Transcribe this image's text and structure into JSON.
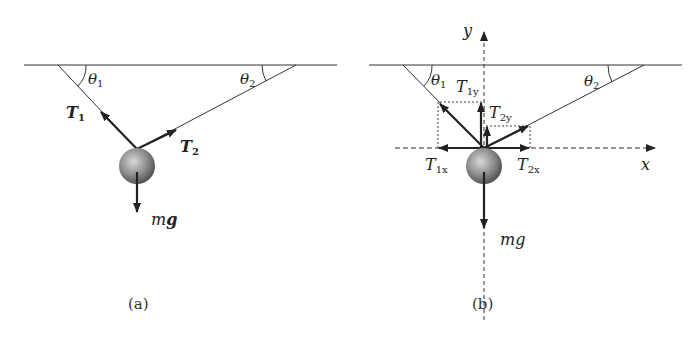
{
  "figure": {
    "panel_a": {
      "caption": "(a)",
      "angle_left": {
        "symbol": "θ",
        "sub": "1"
      },
      "angle_right": {
        "symbol": "θ",
        "sub": "2"
      },
      "tension_1": {
        "symbol": "T",
        "sub": "1"
      },
      "tension_2": {
        "symbol": "T",
        "sub": "2"
      },
      "weight": {
        "prefix": "m",
        "symbol": "g"
      }
    },
    "panel_b": {
      "caption": "(b)",
      "angle_left": {
        "symbol": "θ",
        "sub": "1"
      },
      "angle_right": {
        "symbol": "θ",
        "sub": "2"
      },
      "t1y": {
        "symbol": "T",
        "sub": "1y"
      },
      "t2y": {
        "symbol": "T",
        "sub": "2y"
      },
      "t1x": {
        "symbol": "T",
        "sub": "1x"
      },
      "t2x": {
        "symbol": "T",
        "sub": "2x"
      },
      "weight": "mg",
      "axis_x": "x",
      "axis_y": "y"
    }
  },
  "colors": {
    "line": "#333333",
    "ball_light": "#d8d8d8",
    "ball_dark": "#555555"
  }
}
